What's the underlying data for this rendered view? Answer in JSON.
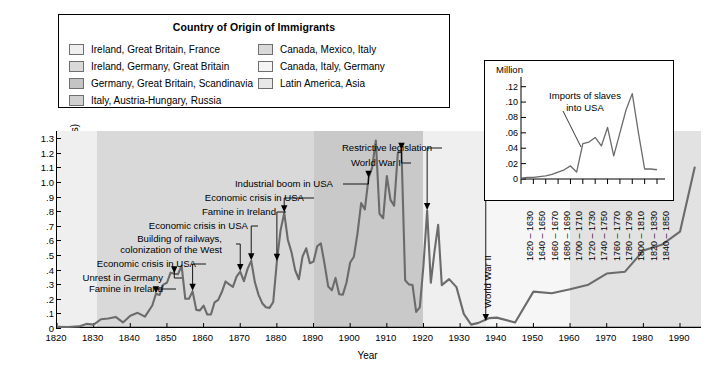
{
  "legend": {
    "title": "Country of Origin of Immigrants",
    "left_items": [
      {
        "label": "Ireland, Great Britain, France",
        "color": "#efefef"
      },
      {
        "label": "Ireland, Germany, Great Britain",
        "color": "#d9d9d9"
      },
      {
        "label": "Germany, Great Britain, Scandinavia",
        "color": "#c4c4c4"
      },
      {
        "label": "Italy, Austria-Hungary, Russia",
        "color": "#d0d0d0"
      }
    ],
    "right_items": [
      {
        "label": "Canada, Mexico, Italy",
        "color": "#d9d9d9"
      },
      {
        "label": "Canada, Italy, Germany",
        "color": "#f4f4f4"
      },
      {
        "label": "Latin America, Asia",
        "color": "#e8e8e8"
      }
    ]
  },
  "chart_data": {
    "type": "line",
    "title": "",
    "xlabel": "Year",
    "ylabel": "White immigration (in millions)",
    "xlim": [
      1820,
      1996
    ],
    "ylim": [
      0,
      1.35
    ],
    "ytick_labels": [
      "0",
      ".1",
      ".2",
      ".3",
      ".4",
      ".5",
      ".6",
      ".7",
      ".8",
      ".9",
      "1.0",
      "1.1",
      "1.2",
      "1.3"
    ],
    "ytick_values": [
      0,
      0.1,
      0.2,
      0.3,
      0.4,
      0.5,
      0.6,
      0.7,
      0.8,
      0.9,
      1.0,
      1.1,
      1.2,
      1.3
    ],
    "xtick_labels": [
      "1820",
      "1830",
      "1840",
      "1850",
      "1860",
      "1870",
      "1880",
      "1890",
      "1900",
      "1910",
      "1920",
      "1930",
      "1940",
      "1950",
      "1960",
      "1970",
      "1980",
      "1990"
    ],
    "xtick_values": [
      1820,
      1830,
      1840,
      1850,
      1860,
      1870,
      1880,
      1890,
      1900,
      1910,
      1920,
      1930,
      1940,
      1950,
      1960,
      1970,
      1980,
      1990
    ],
    "grid": false,
    "line_color": "#6b6b6b",
    "series": [
      {
        "name": "White immigration",
        "x": [
          1820,
          1823,
          1826,
          1828,
          1830,
          1832,
          1834,
          1836,
          1838,
          1840,
          1842,
          1844,
          1846,
          1847,
          1848,
          1849,
          1850,
          1851,
          1852,
          1853,
          1854,
          1855,
          1856,
          1857,
          1858,
          1859,
          1860,
          1861,
          1862,
          1863,
          1864,
          1865,
          1866,
          1867,
          1868,
          1869,
          1870,
          1871,
          1872,
          1873,
          1874,
          1875,
          1876,
          1877,
          1878,
          1879,
          1880,
          1881,
          1882,
          1883,
          1884,
          1885,
          1886,
          1887,
          1888,
          1889,
          1890,
          1891,
          1892,
          1893,
          1894,
          1895,
          1896,
          1897,
          1898,
          1899,
          1900,
          1901,
          1902,
          1903,
          1904,
          1905,
          1906,
          1907,
          1908,
          1909,
          1910,
          1911,
          1912,
          1913,
          1914,
          1915,
          1916,
          1917,
          1918,
          1919,
          1920,
          1921,
          1922,
          1923,
          1924,
          1925,
          1927,
          1929,
          1931,
          1933,
          1935,
          1938,
          1940,
          1945,
          1950,
          1955,
          1960,
          1965,
          1970,
          1975,
          1980,
          1985,
          1990,
          1994
        ],
        "values": [
          0.008,
          0.007,
          0.011,
          0.028,
          0.023,
          0.06,
          0.065,
          0.076,
          0.038,
          0.084,
          0.104,
          0.078,
          0.154,
          0.235,
          0.226,
          0.297,
          0.31,
          0.379,
          0.372,
          0.368,
          0.428,
          0.2,
          0.2,
          0.251,
          0.124,
          0.121,
          0.154,
          0.092,
          0.092,
          0.176,
          0.193,
          0.248,
          0.319,
          0.299,
          0.282,
          0.352,
          0.387,
          0.321,
          0.405,
          0.46,
          0.313,
          0.227,
          0.17,
          0.142,
          0.138,
          0.178,
          0.457,
          0.669,
          0.789,
          0.603,
          0.518,
          0.395,
          0.334,
          0.49,
          0.546,
          0.444,
          0.455,
          0.56,
          0.58,
          0.44,
          0.285,
          0.259,
          0.343,
          0.231,
          0.229,
          0.312,
          0.449,
          0.488,
          0.649,
          0.857,
          0.813,
          1.026,
          1.101,
          1.285,
          0.783,
          0.752,
          1.042,
          0.878,
          0.838,
          1.198,
          1.218,
          0.327,
          0.299,
          0.295,
          0.11,
          0.141,
          0.43,
          0.805,
          0.31,
          0.523,
          0.707,
          0.294,
          0.335,
          0.28,
          0.097,
          0.023,
          0.035,
          0.068,
          0.071,
          0.038,
          0.249,
          0.238,
          0.265,
          0.297,
          0.373,
          0.386,
          0.531,
          0.57,
          0.66,
          1.1
        ],
        "units": "millions"
      }
    ],
    "bands": [
      {
        "from": 1820,
        "to": 1831,
        "color": "#efefef",
        "origin": "Ireland, Great Britain, France"
      },
      {
        "from": 1831,
        "to": 1890,
        "color": "#d9d9d9",
        "origin": "Ireland, Germany, Great Britain"
      },
      {
        "from": 1890,
        "to": 1920,
        "color": "#c9c9c9",
        "origin": "Germany, Great Britain, Scandinavia / Italy, Austria-Hungary, Russia"
      },
      {
        "from": 1920,
        "to": 1937,
        "color": "#efefef",
        "origin": "Canada, Mexico, Italy"
      },
      {
        "from": 1937,
        "to": 1960,
        "color": "#f6f6f6",
        "origin": "Canada, Italy, Germany"
      },
      {
        "from": 1960,
        "to": 1996,
        "color": "#e2e2e2",
        "origin": "Latin America, Asia"
      }
    ],
    "annotations": [
      {
        "text": "Famine in Ireland",
        "year": 1847,
        "value": 0.235,
        "side": "right"
      },
      {
        "text": "Unrest in Germany",
        "year": 1852,
        "value": 0.372,
        "side": "right"
      },
      {
        "text": "Economic crisis in USA",
        "year": 1857,
        "value": 0.251,
        "side": "right"
      },
      {
        "text": "Building of railways,",
        "year": 1870,
        "value": 0.387,
        "side": "right"
      },
      {
        "text": "colonization of the West",
        "year": 1870,
        "value": 0.387,
        "side": "right"
      },
      {
        "text": "Economic crisis in USA",
        "year": 1873,
        "value": 0.46,
        "side": "right"
      },
      {
        "text": "Famine in Ireland",
        "year": 1880,
        "value": 0.457,
        "side": "right"
      },
      {
        "text": "Economic crisis in USA",
        "year": 1882,
        "value": 0.789,
        "side": "right"
      },
      {
        "text": "Industrial boom in USA",
        "year": 1905,
        "value": 1.026,
        "side": "right"
      },
      {
        "text": "World War I",
        "year": 1914,
        "value": 1.218,
        "side": "right"
      },
      {
        "text": "Restrictive legislation",
        "year": 1921,
        "value": 0.805,
        "side": "right"
      },
      {
        "text": "World War II",
        "year": 1937,
        "value": 0.045,
        "side": "vertical"
      }
    ]
  },
  "inset_chart": {
    "type": "line",
    "unit_label": "Million",
    "title_line1": "Imports of slaves",
    "title_line2": "into USA",
    "ylim": [
      0,
      0.13
    ],
    "ytick_labels": [
      "0",
      ".02",
      ".04",
      ".06",
      ".08",
      ".10",
      ".12"
    ],
    "ytick_values": [
      0,
      0.02,
      0.04,
      0.06,
      0.08,
      0.1,
      0.12
    ],
    "xtick_labels": [
      "1620 – 1630",
      "1640 – 1650",
      "1660 – 1670",
      "1680 – 1690",
      "1700 – 1710",
      "1720 – 1730",
      "1740 – 1750",
      "1760 – 1770",
      "1780 – 1790",
      "1800 – 1810",
      "1820 – 1830",
      "1840 – 1850"
    ],
    "line_color": "#6b6b6b",
    "values": [
      0.001,
      0.002,
      0.002,
      0.003,
      0.004,
      0.006,
      0.009,
      0.012,
      0.017,
      0.009,
      0.046,
      0.048,
      0.054,
      0.043,
      0.067,
      0.03,
      0.06,
      0.09,
      0.111,
      0.06,
      0.013,
      0.013,
      0.012
    ]
  }
}
